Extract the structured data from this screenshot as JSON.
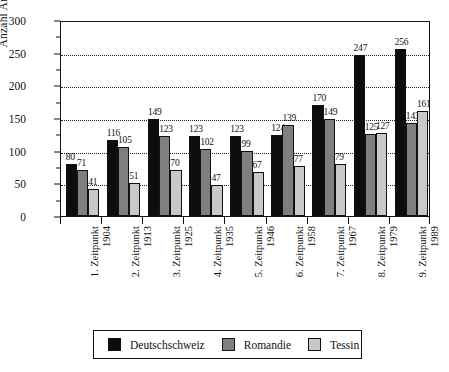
{
  "chart_data": {
    "type": "bar",
    "title": "",
    "subtitle": "",
    "xlabel": "",
    "ylabel": "Anzahl Artikel",
    "ylim": [
      0,
      300
    ],
    "yticks": [
      0,
      50,
      100,
      150,
      200,
      250,
      300
    ],
    "ytick_labels": [
      "0",
      "50",
      "100",
      "150",
      "200",
      "250",
      "300"
    ],
    "yminor_ticks": [
      25,
      75,
      125,
      175,
      225,
      275
    ],
    "grid": "horizontal-dotted",
    "legend_position": "bottom",
    "categories": [
      "1. Zeitpunkt 1904",
      "2. Zeitpunkt 1913",
      "3. Zeitpunkt 1925",
      "4. Zeitpunkt 1935",
      "5. Zeitpunkt 1946",
      "6. Zeitpunkt 1958",
      "7. Zeitpunkt 1967",
      "8. Zeitpunkt 1979",
      "9. Zeitpunkt 1989"
    ],
    "category_lines": [
      {
        "line1": "1. Zeitpunkt",
        "line2": "1904"
      },
      {
        "line1": "2. Zeitpunkt",
        "line2": "1913"
      },
      {
        "line1": "3. Zeitpunkt",
        "line2": "1925"
      },
      {
        "line1": "4. Zeitpunkt",
        "line2": "1935"
      },
      {
        "line1": "5. Zeitpunkt",
        "line2": "1946"
      },
      {
        "line1": "6. Zeitpunkt",
        "line2": "1958"
      },
      {
        "line1": "7. Zeitpunkt",
        "line2": "1967"
      },
      {
        "line1": "8. Zeitpunkt",
        "line2": "1979"
      },
      {
        "line1": "9. Zeitpunkt",
        "line2": "1989"
      }
    ],
    "series": [
      {
        "name": "Deutschschweiz",
        "color": "#0d0d0d",
        "values": [
          80,
          116,
          149,
          123,
          123,
          124,
          170,
          247,
          256
        ]
      },
      {
        "name": "Romandie",
        "color": "#7f7f7f",
        "values": [
          71,
          105,
          123,
          102,
          99,
          139,
          149,
          125,
          143
        ]
      },
      {
        "name": "Tessin",
        "color": "#c8c8c8",
        "values": [
          41,
          51,
          70,
          47,
          67,
          77,
          79,
          127,
          161
        ]
      }
    ]
  },
  "legend": {
    "items": [
      {
        "label": "Deutschschweiz",
        "color": "#0d0d0d"
      },
      {
        "label": "Romandie",
        "color": "#7f7f7f"
      },
      {
        "label": "Tessin",
        "color": "#c8c8c8"
      }
    ]
  }
}
